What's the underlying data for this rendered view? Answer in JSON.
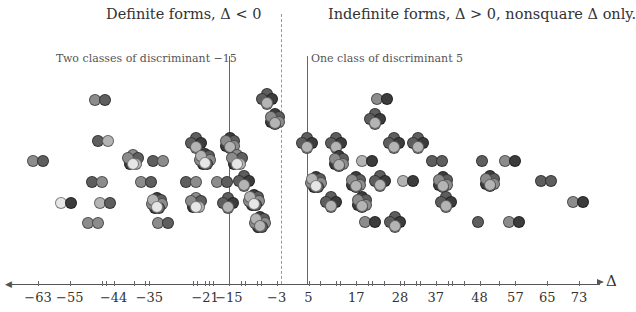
{
  "titles": {
    "left": "Definite forms, Δ < 0",
    "right": "Indefinite forms, Δ > 0, nonsquare Δ only."
  },
  "annotations": {
    "left": "Two classes of discriminant −15",
    "right": "One class of discriminant 5"
  },
  "axis": {
    "label": "Δ",
    "tick_labels": [
      "−63",
      "−55",
      "−44",
      "−35",
      "−21",
      "−15",
      "−3",
      "5",
      "17",
      "28",
      "37",
      "48",
      "57",
      "65",
      "73"
    ]
  },
  "colors": {
    "light": "#e6e6e6",
    "mid_light": "#b4b4b4",
    "mid": "#8c8c8c",
    "dark": "#5e5e5e",
    "darker": "#3c3c3c"
  },
  "chart_data": {
    "type": "scatter",
    "xlabel": "Δ",
    "ylabel": "",
    "regions": [
      {
        "name": "Definite forms, Δ < 0",
        "range": [
          -63,
          0
        ]
      },
      {
        "name": "Indefinite forms, Δ > 0, nonsquare Δ only.",
        "range": [
          0,
          73
        ]
      }
    ],
    "highlighted": [
      {
        "discriminant": -15,
        "note": "Two classes of discriminant −15"
      },
      {
        "discriminant": 5,
        "note": "One class of discriminant 5"
      }
    ],
    "x_ticks": [
      -63,
      -55,
      -44,
      -35,
      -21,
      -15,
      -3,
      5,
      17,
      28,
      37,
      48,
      57,
      65,
      73
    ],
    "xlim": [
      -65,
      76
    ],
    "grid": false,
    "clusters_note": "Each cluster of overlapping shaded circles represents forms of a given discriminant; clusters are stacked vertically above their Δ position."
  }
}
